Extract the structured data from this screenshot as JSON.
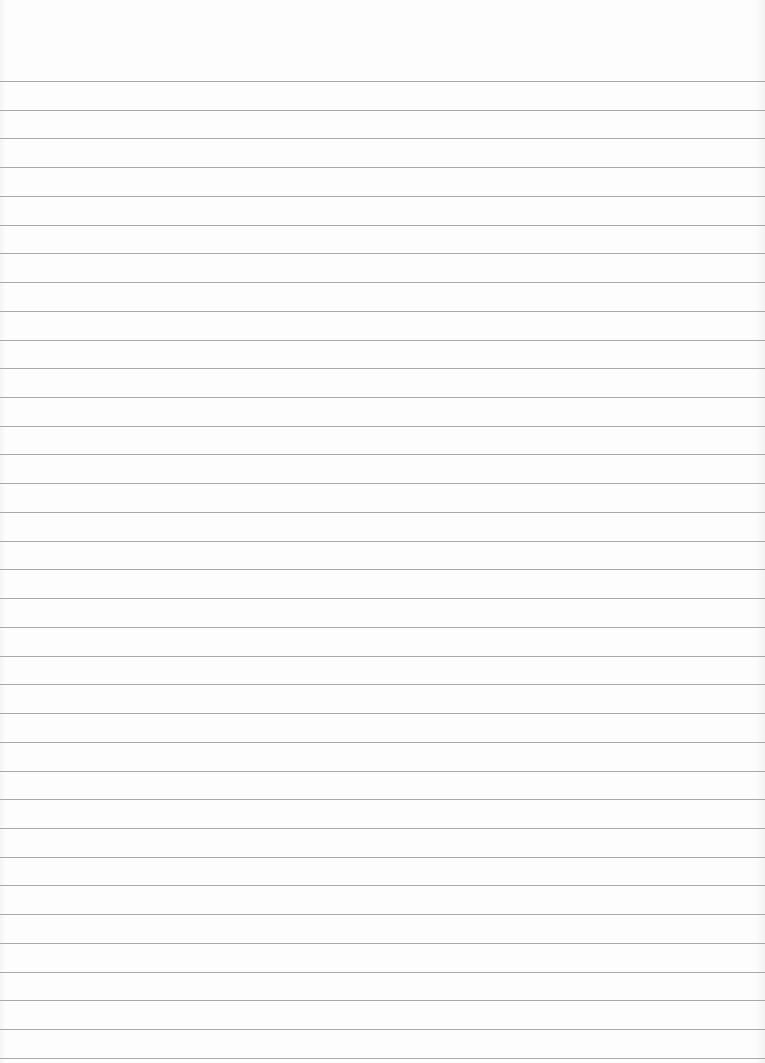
{
  "paper": {
    "type": "lined-paper",
    "line_count": 35,
    "first_line_y": 81,
    "line_spacing": 28.73,
    "line_color": "#9a9a9a",
    "background_color": "#fbfbfb"
  }
}
